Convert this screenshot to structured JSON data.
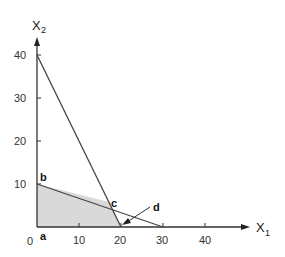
{
  "diagram": {
    "type": "linear-programming-feasible-region",
    "x_axis": {
      "label": "X",
      "subscript": "1",
      "ticks": [
        "10",
        "20",
        "30",
        "40"
      ]
    },
    "y_axis": {
      "label": "X",
      "subscript": "2",
      "ticks": [
        "10",
        "20",
        "30",
        "40"
      ]
    },
    "origin_label": "0",
    "points": {
      "a": "a",
      "b": "b",
      "c": "c",
      "d": "d"
    },
    "constraints": [
      {
        "from": [
          0,
          40
        ],
        "to": [
          20,
          0
        ]
      },
      {
        "from": [
          0,
          10
        ],
        "to": [
          30,
          0
        ]
      }
    ],
    "feasible_region": [
      [
        0,
        0
      ],
      [
        0,
        10
      ],
      [
        17.1,
        5.7
      ],
      [
        20,
        0
      ]
    ],
    "colors": {
      "region_fill": "#d9d9d9",
      "line": "#444444",
      "axis": "#333333"
    }
  }
}
